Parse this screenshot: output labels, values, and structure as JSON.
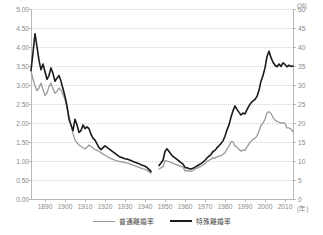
{
  "chart_data": {
    "type": "line",
    "title": "",
    "subtitle": "",
    "xlabel": "(年)",
    "ylabel": "",
    "y2label": "(%)",
    "xlim": [
      1883,
      2014
    ],
    "ylim": [
      0.0,
      5.0
    ],
    "y2lim": [
      0,
      50
    ],
    "grid": true,
    "legend_position": "bottom-center",
    "x_ticks": [
      1890,
      1900,
      1910,
      1920,
      1930,
      1940,
      1950,
      1960,
      1970,
      1980,
      1990,
      2000,
      2010
    ],
    "x_tick_labels": [
      "1890",
      "1900",
      "1910",
      "1920",
      "1930",
      "1940",
      "1950",
      "1960",
      "1970",
      "1980",
      "1990",
      "2000",
      "2010"
    ],
    "x_unit_label": "(年)",
    "y_ticks": [
      0.0,
      0.5,
      1.0,
      1.5,
      2.0,
      2.5,
      3.0,
      3.5,
      4.0,
      4.5,
      5.0
    ],
    "y_tick_labels": [
      "0.00",
      "0.50",
      "1.00",
      "1.50",
      "2.00",
      "2.50",
      "3.00",
      "3.50",
      "4.00",
      "4.50",
      "5.00"
    ],
    "y2_ticks": [
      0,
      5,
      10,
      15,
      20,
      25,
      30,
      35,
      40,
      45,
      50
    ],
    "y2_tick_labels": [
      "0",
      "5",
      "10",
      "15",
      "20",
      "25",
      "30",
      "35",
      "40",
      "45",
      "50"
    ],
    "y2_unit_label": "(%)",
    "data_gap_years": [
      1944,
      1945,
      1946
    ],
    "series": [
      {
        "name": "普通離婚率",
        "axis": "left",
        "color": "#9a9a9a",
        "width": 1.3,
        "x": [
          1883,
          1884,
          1885,
          1886,
          1887,
          1888,
          1889,
          1890,
          1891,
          1892,
          1893,
          1894,
          1895,
          1896,
          1897,
          1898,
          1899,
          1900,
          1901,
          1902,
          1903,
          1904,
          1905,
          1906,
          1907,
          1908,
          1909,
          1910,
          1911,
          1912,
          1913,
          1914,
          1915,
          1916,
          1917,
          1918,
          1919,
          1920,
          1921,
          1922,
          1923,
          1924,
          1925,
          1926,
          1927,
          1928,
          1929,
          1930,
          1931,
          1932,
          1933,
          1934,
          1935,
          1936,
          1937,
          1938,
          1939,
          1940,
          1941,
          1942,
          1943,
          1947,
          1948,
          1949,
          1950,
          1951,
          1952,
          1953,
          1954,
          1955,
          1956,
          1957,
          1958,
          1959,
          1960,
          1961,
          1962,
          1963,
          1964,
          1965,
          1966,
          1967,
          1968,
          1969,
          1970,
          1971,
          1972,
          1973,
          1974,
          1975,
          1976,
          1977,
          1978,
          1979,
          1980,
          1981,
          1982,
          1983,
          1984,
          1985,
          1986,
          1987,
          1988,
          1989,
          1990,
          1991,
          1992,
          1993,
          1994,
          1995,
          1996,
          1997,
          1998,
          1999,
          2000,
          2001,
          2002,
          2003,
          2004,
          2005,
          2006,
          2007,
          2008,
          2009,
          2010,
          2011,
          2012,
          2013,
          2014
        ],
        "values": [
          3.38,
          3.15,
          2.98,
          2.85,
          2.92,
          3.05,
          2.88,
          2.72,
          2.8,
          2.95,
          3.05,
          2.9,
          2.78,
          2.84,
          2.92,
          2.86,
          2.75,
          2.62,
          2.4,
          2.18,
          1.95,
          1.72,
          1.55,
          1.48,
          1.42,
          1.38,
          1.35,
          1.32,
          1.36,
          1.42,
          1.38,
          1.34,
          1.3,
          1.28,
          1.25,
          1.22,
          1.18,
          1.15,
          1.12,
          1.09,
          1.06,
          1.04,
          1.02,
          1.0,
          0.99,
          0.98,
          0.97,
          0.96,
          0.95,
          0.93,
          0.91,
          0.89,
          0.87,
          0.85,
          0.83,
          0.81,
          0.79,
          0.78,
          0.76,
          0.72,
          0.68,
          0.79,
          0.82,
          0.85,
          1.01,
          1.0,
          0.98,
          0.96,
          0.94,
          0.92,
          0.9,
          0.88,
          0.86,
          0.84,
          0.74,
          0.75,
          0.74,
          0.73,
          0.75,
          0.79,
          0.81,
          0.84,
          0.86,
          0.9,
          0.93,
          0.99,
          1.02,
          1.04,
          1.09,
          1.07,
          1.11,
          1.13,
          1.14,
          1.18,
          1.22,
          1.32,
          1.39,
          1.51,
          1.5,
          1.39,
          1.37,
          1.3,
          1.26,
          1.29,
          1.28,
          1.37,
          1.45,
          1.52,
          1.57,
          1.6,
          1.66,
          1.78,
          1.94,
          2.0,
          2.1,
          2.27,
          2.3,
          2.25,
          2.15,
          2.08,
          2.04,
          2.02,
          1.99,
          2.01,
          1.99,
          1.87,
          1.87,
          1.84,
          1.77
        ]
      },
      {
        "name": "特殊離婚率",
        "axis": "right",
        "color": "#1a1a1a",
        "width": 1.6,
        "x": [
          1883,
          1884,
          1885,
          1886,
          1887,
          1888,
          1889,
          1890,
          1891,
          1892,
          1893,
          1894,
          1895,
          1896,
          1897,
          1898,
          1899,
          1900,
          1901,
          1902,
          1903,
          1904,
          1905,
          1906,
          1907,
          1908,
          1909,
          1910,
          1911,
          1912,
          1913,
          1914,
          1915,
          1916,
          1917,
          1918,
          1919,
          1920,
          1921,
          1922,
          1923,
          1924,
          1925,
          1926,
          1927,
          1928,
          1929,
          1930,
          1931,
          1932,
          1933,
          1934,
          1935,
          1936,
          1937,
          1938,
          1939,
          1940,
          1941,
          1942,
          1943,
          1947,
          1948,
          1949,
          1950,
          1951,
          1952,
          1953,
          1954,
          1955,
          1956,
          1957,
          1958,
          1959,
          1960,
          1961,
          1962,
          1963,
          1964,
          1965,
          1966,
          1967,
          1968,
          1969,
          1970,
          1971,
          1972,
          1973,
          1974,
          1975,
          1976,
          1977,
          1978,
          1979,
          1980,
          1981,
          1982,
          1983,
          1984,
          1985,
          1986,
          1987,
          1988,
          1989,
          1990,
          1991,
          1992,
          1993,
          1994,
          1995,
          1996,
          1997,
          1998,
          1999,
          2000,
          2001,
          2002,
          2003,
          2004,
          2005,
          2006,
          2007,
          2008,
          2009,
          2010,
          2011,
          2012,
          2013,
          2014
        ],
        "values": [
          33.8,
          38.5,
          43.5,
          40.0,
          36.5,
          34.0,
          35.5,
          33.5,
          31.5,
          32.5,
          34.5,
          33.0,
          31.0,
          31.8,
          32.5,
          31.0,
          29.0,
          27.0,
          24.5,
          21.0,
          19.5,
          18.0,
          21.0,
          19.5,
          17.5,
          18.0,
          19.5,
          18.5,
          19.0,
          18.5,
          17.0,
          16.0,
          15.5,
          14.5,
          13.5,
          13.0,
          13.5,
          14.0,
          13.6,
          13.2,
          12.8,
          12.4,
          12.0,
          11.6,
          11.2,
          11.0,
          10.8,
          10.6,
          10.5,
          10.3,
          10.1,
          9.9,
          9.7,
          9.5,
          9.3,
          9.0,
          8.8,
          8.6,
          8.3,
          7.8,
          7.2,
          8.8,
          9.5,
          10.2,
          12.5,
          13.2,
          12.5,
          11.8,
          11.2,
          10.8,
          10.4,
          10.0,
          9.6,
          9.2,
          8.3,
          8.2,
          8.0,
          7.9,
          8.1,
          8.4,
          8.7,
          9.0,
          9.3,
          9.7,
          10.2,
          10.8,
          11.3,
          11.7,
          12.5,
          12.8,
          13.5,
          14.0,
          14.6,
          15.3,
          16.5,
          18.2,
          19.5,
          21.5,
          23.2,
          24.5,
          23.6,
          22.8,
          22.1,
          22.6,
          22.4,
          23.5,
          24.5,
          25.3,
          25.8,
          26.2,
          27.0,
          28.6,
          31.0,
          32.5,
          34.5,
          37.5,
          38.9,
          37.2,
          36.0,
          35.2,
          34.8,
          35.5,
          34.9,
          35.8,
          35.4,
          34.8,
          35.2,
          34.9,
          35.0
        ]
      }
    ]
  },
  "legend": {
    "items": [
      {
        "label": "普通離婚率",
        "key": "futsu"
      },
      {
        "label": "特殊離婚率",
        "key": "tokushu"
      }
    ]
  },
  "colors": {
    "series_light": "#9a9a9a",
    "series_dark": "#1a1a1a",
    "axis": "#b8b8b8",
    "grid": "#d2d2d2",
    "tick_text": "#8a8a8a",
    "legend_text": "#4a4a4a",
    "background": "#ffffff"
  }
}
